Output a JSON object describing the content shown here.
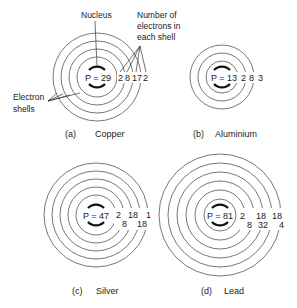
{
  "labels": {
    "nucleus": "Nucleus",
    "electron_count_line1": "Number of",
    "electron_count_line2": "electrons in",
    "electron_count_line3": "each shell",
    "shells_line1": "Electron",
    "shells_line2": "shells"
  },
  "atoms": [
    {
      "letter": "(a)",
      "name": "Copper",
      "protons": "P = 29",
      "shells": [
        "2",
        "8",
        "17",
        "2"
      ]
    },
    {
      "letter": "(b)",
      "name": "Aluminium",
      "protons": "P = 13",
      "shells": [
        "2",
        "8",
        "3"
      ]
    },
    {
      "letter": "(c)",
      "name": "Silver",
      "protons": "P = 47",
      "shells": [
        "2",
        "8",
        "18",
        "18",
        "1"
      ]
    },
    {
      "letter": "(d)",
      "name": "Lead",
      "protons": "P = 81",
      "shells": [
        "2",
        "8",
        "18",
        "32",
        "18",
        "4"
      ]
    }
  ]
}
